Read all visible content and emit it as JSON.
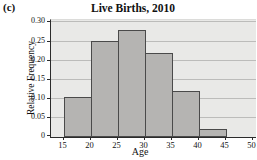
{
  "figure_label": "(c)",
  "chart_data": {
    "type": "bar",
    "title": "Live Births, 2010",
    "xlabel": "Age",
    "ylabel": "Relative Frequency",
    "categories": [
      "15-20",
      "20-25",
      "25-30",
      "30-35",
      "35-40",
      "40-45",
      "45-50"
    ],
    "values": [
      0.105,
      0.25,
      0.28,
      0.22,
      0.12,
      0.02,
      0
    ],
    "bin_edges": [
      15,
      20,
      25,
      30,
      35,
      40,
      45,
      50
    ],
    "x_tick_labels": [
      "15",
      "20",
      "25",
      "30",
      "35",
      "40",
      "45",
      "50"
    ],
    "y_ticks": [
      0.3,
      0.25,
      0.2,
      0.15,
      0.1,
      0.05,
      0
    ],
    "y_tick_labels": [
      "0.30",
      "0.25",
      "0.20",
      "0.15",
      "0.10",
      "0.05",
      "0"
    ],
    "ylim": [
      0,
      0.3
    ],
    "grid": "horizontal",
    "colors": {
      "page_bg": "#ffffff",
      "plot_bg": "#e9e9e7",
      "gridline": "#bcbcba",
      "bar_fill": "#b5b4b2",
      "bar_border": "#4a4a4a",
      "axis": "#2b2b2b",
      "text": "#111111"
    }
  }
}
